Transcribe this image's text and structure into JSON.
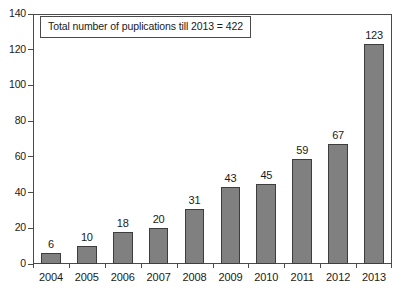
{
  "chart_data": {
    "type": "bar",
    "title": "",
    "xlabel": "",
    "ylabel": "",
    "categories": [
      "2004",
      "2005",
      "2006",
      "2007",
      "2008",
      "2009",
      "2010",
      "2011",
      "2012",
      "2013"
    ],
    "values": [
      6,
      10,
      18,
      20,
      31,
      43,
      45,
      59,
      67,
      123
    ],
    "ylim": [
      0,
      140
    ],
    "yticks": [
      0,
      20,
      40,
      60,
      80,
      100,
      120,
      140
    ],
    "ytick_labels": [
      "0",
      "20",
      "40",
      "60",
      "80",
      "100",
      "120",
      "140"
    ],
    "grid": false,
    "legend": null,
    "annotations": [
      {
        "name": "total-publications-note",
        "text": "Total number of puplications till 2013 = 422",
        "position": "top-left-inside-plot",
        "boxed": true
      }
    ],
    "bar_color": "#808080",
    "bar_edge_color": "#3d3d3d",
    "frame_color": "#4a4a4a",
    "background_color": "#ffffff",
    "data_labels_shown": true
  }
}
